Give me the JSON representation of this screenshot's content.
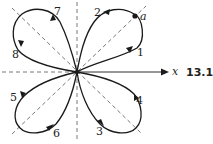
{
  "figure": {
    "number": "13.10",
    "axis_label": "x",
    "point_label": "a",
    "arrow_labels": [
      "1",
      "2",
      "3",
      "4",
      "5",
      "6",
      "7",
      "8"
    ],
    "colors": {
      "curve": "#1a1a1a",
      "dashed": "#555555",
      "text": "#222222"
    }
  }
}
